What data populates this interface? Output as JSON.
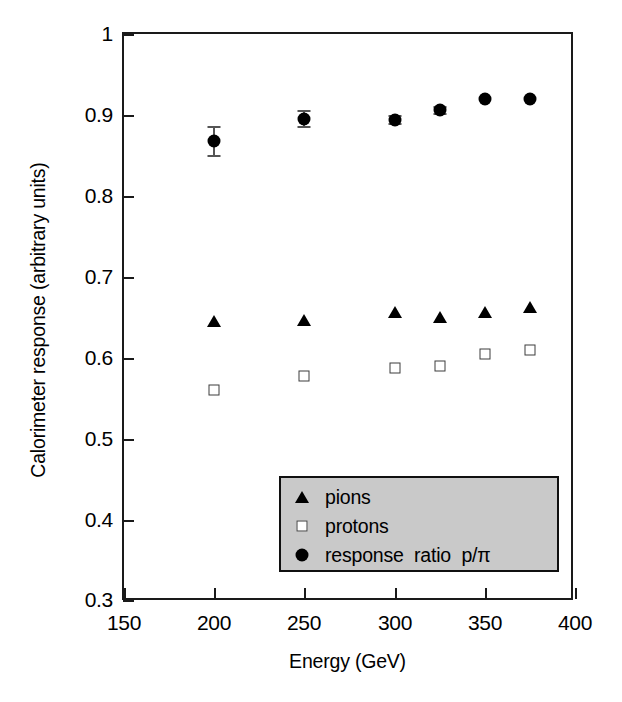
{
  "chart_data": {
    "type": "scatter",
    "title": "",
    "xlabel": "Energy (GeV)",
    "ylabel": "Calorimeter response (arbitrary units)",
    "xlim": [
      150,
      400
    ],
    "ylim": [
      0.3,
      1.0
    ],
    "xticks": [
      "150",
      "200",
      "250",
      "300",
      "350",
      "400"
    ],
    "xtick_values": [
      150,
      200,
      250,
      300,
      350,
      375,
      400
    ],
    "yticks": [
      "0.3",
      "0.4",
      "0.5",
      "0.6",
      "0.7",
      "0.8",
      "0.9",
      "1"
    ],
    "grid": false,
    "legend_position": "lower center",
    "x": [
      200,
      250,
      300,
      325,
      350,
      375
    ],
    "series": [
      {
        "name": "pions",
        "marker": "filled-triangle",
        "color": "#000000",
        "values": [
          0.646,
          0.647,
          0.657,
          0.651,
          0.657,
          0.663
        ]
      },
      {
        "name": "protons",
        "marker": "open-square",
        "color": "#3d3d3d",
        "values": [
          0.561,
          0.578,
          0.588,
          0.591,
          0.606,
          0.61
        ]
      },
      {
        "name": "response  ratio  p/π",
        "marker": "filled-circle",
        "color": "#000000",
        "values": [
          0.868,
          0.895,
          0.894,
          0.906,
          0.92,
          0.92
        ],
        "errors": [
          0.018,
          0.01,
          0.005,
          0.004,
          0.0,
          0.0
        ]
      }
    ]
  },
  "axes": {
    "x_title": "Energy (GeV)",
    "y_title": "Calorimeter response (arbitrary units)",
    "x_tick_labels": [
      "150",
      "200",
      "250",
      "300",
      "350",
      "400"
    ],
    "y_tick_labels": [
      "1",
      "0.9",
      "0.8",
      "0.7",
      "0.6",
      "0.5",
      "0.4",
      "0.3"
    ]
  },
  "legend": {
    "entries": [
      {
        "label": "pions",
        "symbol": "filled-triangle"
      },
      {
        "label": "protons",
        "symbol": "open-square"
      },
      {
        "label": "response  ratio  p/π",
        "symbol": "filled-circle"
      }
    ],
    "background_color": "#c9c9c9",
    "border_color": "#101010"
  }
}
